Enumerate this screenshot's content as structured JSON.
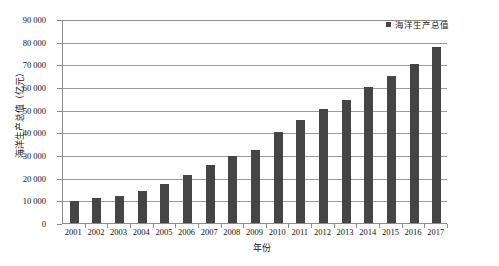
{
  "chart_data": {
    "type": "bar",
    "title": "",
    "xlabel": "年份",
    "ylabel": "海洋生产总值（亿元）",
    "ylim": [
      0,
      90000
    ],
    "ytick_step": 10000,
    "grid": true,
    "legend_position": "top-right",
    "series_name": "海洋生产总值",
    "bar_color": "#454545",
    "axis_color": "#8c8c8c",
    "grid_color": "#9a9a9a",
    "categories": [
      "2001",
      "2002",
      "2003",
      "2004",
      "2005",
      "2006",
      "2007",
      "2008",
      "2009",
      "2010",
      "2011",
      "2012",
      "2013",
      "2014",
      "2015",
      "2016",
      "2017"
    ],
    "values": [
      9500,
      11000,
      11900,
      14000,
      17000,
      21000,
      25600,
      29700,
      32000,
      40000,
      45500,
      50100,
      54300,
      60000,
      65000,
      70000,
      77600
    ],
    "ytick_labels": [
      "90 000",
      "80 000",
      "70 000",
      "60 000",
      "50 000",
      "40 000",
      "30 000",
      "20 000",
      "10 000",
      "0"
    ],
    "ytick_values": [
      90000,
      80000,
      70000,
      60000,
      50000,
      40000,
      30000,
      20000,
      10000,
      0
    ]
  },
  "legend": {
    "entries": [
      {
        "label": "海洋生产总值",
        "color": "#454545",
        "marker": "square-marker"
      }
    ]
  }
}
